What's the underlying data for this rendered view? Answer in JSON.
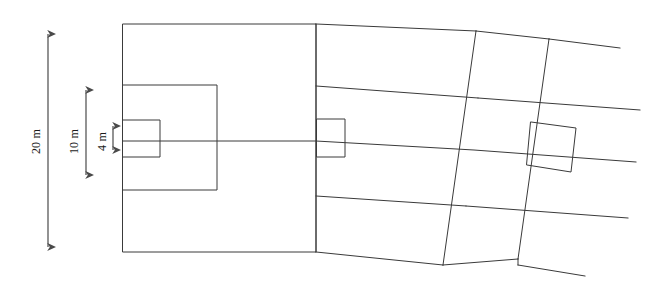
{
  "figure": {
    "type": "engineering-elevation-sketch",
    "background_color": "#ffffff",
    "line_color": "#3a3a3a",
    "line_width": 1,
    "width": 647,
    "height": 290
  },
  "dimensions": [
    {
      "id": "overall-height",
      "label": "20 m",
      "value": 20,
      "unit": "m",
      "orientation": "vertical",
      "x": 48,
      "y_top": 26,
      "y_bottom": 255,
      "label_x": 36,
      "label_y": 140
    },
    {
      "id": "mid-height",
      "label": "10 m",
      "value": 10,
      "unit": "m",
      "orientation": "vertical",
      "x": 86,
      "y_top": 82,
      "y_bottom": 183,
      "label_x": 74,
      "label_y": 140
    },
    {
      "id": "opening-height",
      "label": "4 m",
      "value": 4,
      "unit": "m",
      "orientation": "vertical",
      "x": 113,
      "y_top": 119,
      "y_bottom": 157,
      "label_x": 102,
      "label_y": 140
    }
  ],
  "panels": [
    {
      "id": "panel-left",
      "name": "left-bay",
      "skew": 0,
      "outline": [
        [
          123,
          24
        ],
        [
          316,
          24
        ],
        [
          316,
          252
        ],
        [
          123,
          252
        ]
      ],
      "inner_rect_medium": [
        [
          123,
          85
        ],
        [
          217,
          85
        ],
        [
          217,
          190
        ],
        [
          123,
          190
        ]
      ],
      "inner_rect_small": [
        [
          123,
          120
        ],
        [
          160,
          120
        ],
        [
          160,
          157
        ],
        [
          123,
          157
        ]
      ]
    },
    {
      "id": "panel-middle",
      "name": "middle-bay",
      "skew": 1,
      "outline": [
        [
          316,
          24
        ],
        [
          476,
          31
        ],
        [
          443,
          265
        ],
        [
          316,
          252
        ]
      ],
      "inner_rect_small": [
        [
          317,
          119
        ],
        [
          345,
          119
        ],
        [
          345,
          157
        ],
        [
          317,
          157
        ]
      ],
      "band_lines": [
        [
          [
            316,
            86
          ],
          [
            478,
            98
          ]
        ],
        [
          [
            316,
            141
          ],
          [
            474,
            150
          ]
        ],
        [
          [
            316,
            196
          ],
          [
            466,
            206
          ]
        ]
      ]
    },
    {
      "id": "panel-right",
      "name": "right-bay",
      "skew": 2,
      "outline": [
        [
          476,
          31
        ],
        [
          549,
          39
        ],
        [
          518,
          259
        ],
        [
          443,
          265
        ]
      ],
      "band_lines": [
        [
          [
            478,
            98
          ],
          [
            640,
            110
          ]
        ],
        [
          [
            474,
            150
          ],
          [
            636,
            162
          ]
        ],
        [
          [
            466,
            206
          ],
          [
            628,
            218
          ]
        ]
      ],
      "inner_rect_small_rotated": [
        [
          531,
          122
        ],
        [
          576,
          128
        ],
        [
          571,
          172
        ],
        [
          527,
          165
        ]
      ]
    }
  ],
  "centerline": {
    "id": "horizontal-centerline",
    "from": [
      123,
      141
    ],
    "to": [
      640,
      162
    ]
  },
  "right_tails": {
    "top": [
      [
        549,
        39
      ],
      [
        620,
        48
      ]
    ],
    "bottom": [
      [
        518,
        265
      ],
      [
        585,
        276
      ]
    ]
  }
}
